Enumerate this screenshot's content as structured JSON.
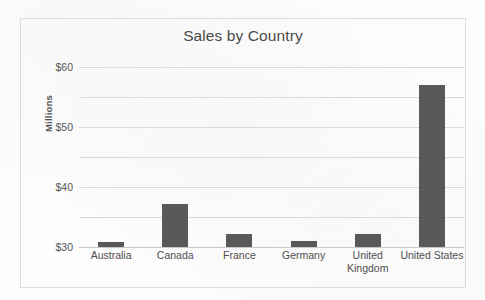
{
  "chart_data": {
    "type": "bar",
    "title": "Sales by Country",
    "xlabel": "",
    "ylabel": "Millions",
    "categories": [
      "Australia",
      "Canada",
      "France",
      "Germany",
      "United Kingdom",
      "United States"
    ],
    "category_lines": [
      [
        "Australia"
      ],
      [
        "Canada"
      ],
      [
        "France"
      ],
      [
        "Germany"
      ],
      [
        "United",
        "Kingdom"
      ],
      [
        "United States"
      ]
    ],
    "values": [
      1.6,
      14.3,
      4.5,
      2.0,
      4.4,
      54.0
    ],
    "ylim": [
      0,
      60
    ],
    "ytick_values": [
      0,
      10,
      20,
      30,
      40,
      50,
      60
    ],
    "ytick_labels": [
      "$0",
      "$10",
      "$20",
      "$30",
      "$40",
      "$50",
      "$60"
    ],
    "grid": "horizontal",
    "legend": "none",
    "bar_color": "#595959",
    "gridline_color": "#d9d9d9",
    "title_color": "#4a4a4a",
    "axis_text_color": "#555555",
    "frame_color": "#dcdcdc",
    "background_color": "#fdfdfd"
  }
}
